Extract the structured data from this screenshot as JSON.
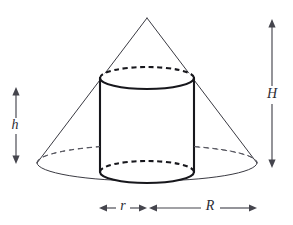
{
  "figure": {
    "background_color": "#ffffff",
    "line_color": "#3a3a42",
    "bold_line_color": "#17171c",
    "label_color": "#2b2b33"
  },
  "labels": {
    "cylinder_height": "h",
    "cone_height": "H",
    "cylinder_radius": "r",
    "cone_radius": "R"
  },
  "shapes": {
    "cone": {
      "name": "cone",
      "apex": {
        "x": 147,
        "y": 18
      },
      "base_center": {
        "x": 147,
        "y": 163
      },
      "base_rx": 110,
      "base_ry": 18
    },
    "cylinder": {
      "name": "cylinder",
      "center_x": 147,
      "rx": 47,
      "ry": 11,
      "top_cy": 78,
      "bottom_cy": 172,
      "left_x": 100,
      "right_x": 194
    }
  },
  "dimensions": {
    "h": {
      "label": "h",
      "orientation": "vertical",
      "x": 16,
      "y_top": 88,
      "y_bottom": 163,
      "label_x": 14,
      "label_y": 125
    },
    "H": {
      "label": "H",
      "orientation": "vertical",
      "x": 272,
      "y_top": 20,
      "y_bottom": 167,
      "label_x": 272,
      "label_y": 95
    },
    "r": {
      "label": "r",
      "orientation": "horizontal",
      "y": 208,
      "x_left": 100,
      "x_right": 146,
      "label_x": 123,
      "label_y": 207
    },
    "R": {
      "label": "R",
      "orientation": "horizontal",
      "y": 208,
      "x_left": 149,
      "x_right": 257,
      "label_x": 210,
      "label_y": 207
    }
  }
}
